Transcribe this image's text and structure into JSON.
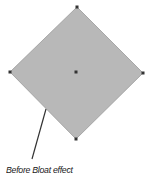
{
  "diagram": {
    "caption": "Before Bloat effect",
    "shape": {
      "type": "diamond",
      "fill_color": "#b8b8b8",
      "stroke_color": "#9a9a9a",
      "anchor_color": "#333333",
      "vertices": {
        "top": [
          77,
          7
        ],
        "right": [
          143,
          73
        ],
        "bottom": [
          76,
          139
        ],
        "left": [
          10,
          72
        ]
      },
      "center": [
        76,
        72
      ]
    },
    "leader_line": {
      "color": "#333333",
      "from": [
        46,
        109
      ],
      "to": [
        32,
        159
      ]
    }
  }
}
